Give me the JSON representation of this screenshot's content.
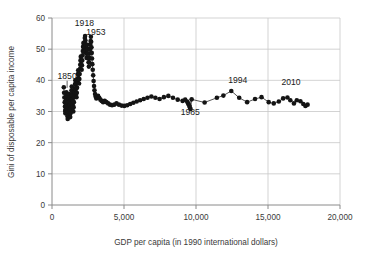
{
  "chart_data": {
    "type": "scatter",
    "title": "",
    "xlabel": "GDP per capita (in 1990 international dollars)",
    "ylabel": "Gini of disposable per capita income",
    "xlim": [
      0,
      20000
    ],
    "ylim": [
      0,
      60
    ],
    "xticks": [
      0,
      5000,
      10000,
      15000,
      20000
    ],
    "xticklabels": [
      "0",
      "5,000",
      "10,000",
      "15,000",
      "20,000"
    ],
    "yticks": [
      0,
      10,
      20,
      30,
      40,
      50,
      60
    ],
    "yticklabels": [
      "0",
      "10",
      "20",
      "30",
      "40",
      "50",
      "60"
    ],
    "grid": true,
    "legend": null,
    "marker": "filled-circle",
    "line_connected": true,
    "annotations": [
      {
        "label": "1850",
        "x": 1050,
        "y": 40.5,
        "leader": true
      },
      {
        "label": "1918",
        "x": 2250,
        "y": 57.5,
        "leader": false
      },
      {
        "label": "1953",
        "x": 3050,
        "y": 54.5,
        "leader": false
      },
      {
        "label": "1985",
        "x": 9600,
        "y": 29.0,
        "leader": true
      },
      {
        "label": "1994",
        "x": 12900,
        "y": 39.0,
        "leader": false
      },
      {
        "label": "2010",
        "x": 16600,
        "y": 38.5,
        "leader": false
      }
    ],
    "series": [
      {
        "name": "Gini vs GDP per capita",
        "points": [
          [
            820,
            37.8
          ],
          [
            840,
            36.0
          ],
          [
            860,
            34.5
          ],
          [
            880,
            33.0
          ],
          [
            900,
            31.6
          ],
          [
            915,
            30.2
          ],
          [
            930,
            29.4
          ],
          [
            945,
            30.6
          ],
          [
            960,
            32.0
          ],
          [
            975,
            33.4
          ],
          [
            990,
            34.8
          ],
          [
            1000,
            36.2
          ],
          [
            1015,
            35.0
          ],
          [
            1030,
            33.6
          ],
          [
            1045,
            32.2
          ],
          [
            1060,
            30.8
          ],
          [
            1070,
            29.6
          ],
          [
            1080,
            28.4
          ],
          [
            1090,
            27.6
          ],
          [
            1100,
            28.6
          ],
          [
            1115,
            30.0
          ],
          [
            1130,
            31.4
          ],
          [
            1145,
            32.8
          ],
          [
            1160,
            34.2
          ],
          [
            1175,
            35.6
          ],
          [
            1190,
            34.4
          ],
          [
            1205,
            33.0
          ],
          [
            1220,
            31.8
          ],
          [
            1235,
            30.4
          ],
          [
            1250,
            29.2
          ],
          [
            1265,
            28.2
          ],
          [
            1280,
            29.4
          ],
          [
            1295,
            31.0
          ],
          [
            1310,
            32.6
          ],
          [
            1325,
            34.0
          ],
          [
            1340,
            35.4
          ],
          [
            1355,
            36.8
          ],
          [
            1370,
            38.0
          ],
          [
            1385,
            36.6
          ],
          [
            1400,
            35.2
          ],
          [
            1420,
            33.8
          ],
          [
            1440,
            32.4
          ],
          [
            1460,
            31.2
          ],
          [
            1480,
            30.0
          ],
          [
            1500,
            31.4
          ],
          [
            1520,
            33.0
          ],
          [
            1540,
            34.6
          ],
          [
            1560,
            36.0
          ],
          [
            1580,
            37.4
          ],
          [
            1600,
            38.8
          ],
          [
            1620,
            40.0
          ],
          [
            1640,
            38.6
          ],
          [
            1660,
            37.2
          ],
          [
            1680,
            35.8
          ],
          [
            1700,
            34.6
          ],
          [
            1720,
            36.0
          ],
          [
            1740,
            37.6
          ],
          [
            1760,
            39.2
          ],
          [
            1780,
            40.6
          ],
          [
            1800,
            42.0
          ],
          [
            1820,
            43.2
          ],
          [
            1840,
            41.8
          ],
          [
            1860,
            40.4
          ],
          [
            1880,
            39.0
          ],
          [
            1900,
            40.4
          ],
          [
            1920,
            42.0
          ],
          [
            1940,
            43.6
          ],
          [
            1960,
            45.0
          ],
          [
            1980,
            46.4
          ],
          [
            2000,
            47.6
          ],
          [
            2020,
            46.2
          ],
          [
            2040,
            44.8
          ],
          [
            2060,
            43.4
          ],
          [
            2080,
            44.8
          ],
          [
            2100,
            46.4
          ],
          [
            2120,
            48.0
          ],
          [
            2140,
            49.4
          ],
          [
            2160,
            50.8
          ],
          [
            2180,
            52.0
          ],
          [
            2200,
            50.6
          ],
          [
            2220,
            49.2
          ],
          [
            2240,
            50.6
          ],
          [
            2260,
            52.2
          ],
          [
            2280,
            53.6
          ],
          [
            2300,
            54.2
          ],
          [
            2320,
            52.8
          ],
          [
            2340,
            51.4
          ],
          [
            2360,
            50.0
          ],
          [
            2380,
            48.6
          ],
          [
            2400,
            47.2
          ],
          [
            2420,
            48.6
          ],
          [
            2440,
            50.0
          ],
          [
            2460,
            51.4
          ],
          [
            2480,
            50.0
          ],
          [
            2500,
            48.6
          ],
          [
            2520,
            47.2
          ],
          [
            2540,
            45.8
          ],
          [
            2560,
            44.4
          ],
          [
            2580,
            45.8
          ],
          [
            2600,
            47.2
          ],
          [
            2620,
            48.6
          ],
          [
            2640,
            50.0
          ],
          [
            2660,
            51.4
          ],
          [
            2680,
            52.6
          ],
          [
            2700,
            54.0
          ],
          [
            2720,
            52.4
          ],
          [
            2740,
            50.6
          ],
          [
            2760,
            48.8
          ],
          [
            2780,
            47.0
          ],
          [
            2800,
            45.2
          ],
          [
            2830,
            43.4
          ],
          [
            2860,
            41.6
          ],
          [
            2890,
            39.8
          ],
          [
            2920,
            38.2
          ],
          [
            2950,
            36.8
          ],
          [
            2990,
            35.6
          ],
          [
            3030,
            34.8
          ],
          [
            3080,
            34.2
          ],
          [
            3140,
            34.6
          ],
          [
            3200,
            35.0
          ],
          [
            3280,
            34.4
          ],
          [
            3360,
            33.8
          ],
          [
            3450,
            33.4
          ],
          [
            3550,
            33.0
          ],
          [
            3660,
            33.4
          ],
          [
            3780,
            33.0
          ],
          [
            3900,
            32.6
          ],
          [
            4030,
            32.2
          ],
          [
            4170,
            32.0
          ],
          [
            4320,
            32.2
          ],
          [
            4480,
            32.6
          ],
          [
            4650,
            32.2
          ],
          [
            4830,
            31.9
          ],
          [
            5020,
            31.8
          ],
          [
            5220,
            32.0
          ],
          [
            5430,
            32.4
          ],
          [
            5650,
            32.8
          ],
          [
            5880,
            33.2
          ],
          [
            6120,
            33.6
          ],
          [
            6370,
            34.0
          ],
          [
            6630,
            34.4
          ],
          [
            6900,
            34.8
          ],
          [
            7180,
            34.4
          ],
          [
            7470,
            34.0
          ],
          [
            7770,
            34.6
          ],
          [
            8080,
            35.0
          ],
          [
            8400,
            34.4
          ],
          [
            8730,
            33.8
          ],
          [
            9070,
            33.4
          ],
          [
            9250,
            33.8
          ],
          [
            9380,
            33.2
          ],
          [
            9450,
            32.6
          ],
          [
            9520,
            32.0
          ],
          [
            9570,
            31.4
          ],
          [
            9620,
            30.8
          ],
          [
            9700,
            33.9
          ],
          [
            10600,
            32.9
          ],
          [
            11450,
            34.4
          ],
          [
            11900,
            35.1
          ],
          [
            12450,
            36.6
          ],
          [
            13000,
            34.4
          ],
          [
            13550,
            33.0
          ],
          [
            14100,
            34.0
          ],
          [
            14550,
            34.6
          ],
          [
            15050,
            33.0
          ],
          [
            15400,
            32.6
          ],
          [
            15750,
            33.2
          ],
          [
            16050,
            34.2
          ],
          [
            16350,
            34.5
          ],
          [
            16550,
            33.6
          ],
          [
            16800,
            32.6
          ],
          [
            17000,
            33.6
          ],
          [
            17250,
            33.3
          ],
          [
            17450,
            32.4
          ],
          [
            17600,
            31.8
          ],
          [
            17750,
            32.2
          ]
        ]
      }
    ]
  }
}
